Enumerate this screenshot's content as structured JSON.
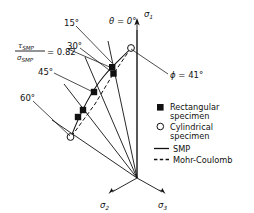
{
  "figure": {
    "type": "deviatoric-plane-failure-criterion",
    "axes": {
      "sigma1": {
        "label": "σ",
        "sub": "1"
      },
      "sigma2": {
        "label": "σ",
        "sub": "2"
      },
      "sigma3": {
        "label": "σ",
        "sub": "3"
      }
    },
    "stress_ratio": {
      "numerator": "τ",
      "numerator_sub": "SMP",
      "denominator": "σ",
      "denominator_sub": "SMP",
      "equals": "= 0.82",
      "value": 0.82
    },
    "friction_angle": {
      "symbol": "ϕ",
      "text": "= 41°",
      "value": 41,
      "unit": "degrees"
    },
    "theta_labels": [
      {
        "id": "theta-0",
        "text": "θ = 0°",
        "value": 0,
        "symbol": "θ"
      },
      {
        "id": "theta-15",
        "text": "15°",
        "value": 15
      },
      {
        "id": "theta-30",
        "text": "30°",
        "value": 30
      },
      {
        "id": "theta-45",
        "text": "45°",
        "value": 45
      },
      {
        "id": "theta-60",
        "text": "60°",
        "value": 60
      }
    ],
    "legend": {
      "items": [
        {
          "id": "rect",
          "marker": "filled-square",
          "line1": "Rectangular",
          "line2": "specimen"
        },
        {
          "id": "cyl",
          "marker": "open-circle",
          "line1": "Cylindrical",
          "line2": "specimen"
        },
        {
          "id": "smp",
          "marker": "solid-line",
          "line1": "SMP",
          "line2": ""
        },
        {
          "id": "mc",
          "marker": "dashed-line",
          "line1": "Mohr-Coulomb",
          "line2": ""
        }
      ]
    },
    "data_points": {
      "rectangular_specimen": [
        {
          "theta": 15,
          "x": 112.5,
          "y": 67.5
        },
        {
          "theta": 15,
          "x": 113.5,
          "y": 73.5
        },
        {
          "theta": 30,
          "x": 94.0,
          "y": 92.0
        },
        {
          "theta": 45,
          "x": 83.0,
          "y": 110.0
        },
        {
          "theta": 45,
          "x": 78.0,
          "y": 117.0
        }
      ],
      "cylindrical_specimen": [
        {
          "theta": 0,
          "x": 131.0,
          "y": 48.0
        },
        {
          "theta": 60,
          "x": 70.5,
          "y": 137.0
        }
      ]
    },
    "colors": {
      "ink": "#111111",
      "background": "#ffffff"
    }
  }
}
